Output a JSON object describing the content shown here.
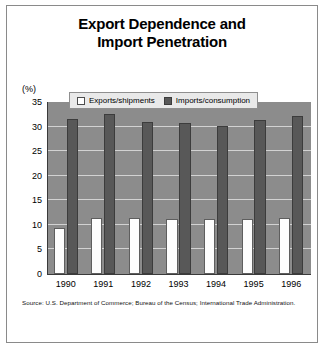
{
  "chart_data": {
    "type": "bar",
    "title": "Export Dependence and Import Penetration",
    "title_lines": [
      "Export Dependence and",
      "Import Penetration"
    ],
    "xlabel": "",
    "ylabel": "",
    "yunit": "(%)",
    "categories": [
      "1990",
      "1991",
      "1992",
      "1993",
      "1994",
      "1995",
      "1996"
    ],
    "series": [
      {
        "name": "Exports/shipments",
        "color": "#ffffff",
        "values": [
          9.3,
          11.3,
          11.3,
          11.2,
          11.1,
          11.1,
          11.4
        ]
      },
      {
        "name": "Imports/consumption",
        "color": "#585858",
        "values": [
          31.5,
          32.5,
          30.9,
          30.8,
          30.2,
          31.3,
          32.2
        ]
      }
    ],
    "ylim": [
      0,
      35
    ],
    "yticks": [
      0,
      5,
      10,
      15,
      20,
      25,
      30,
      35
    ],
    "ytick_labels": [
      "0",
      "5",
      "10",
      "15",
      "20",
      "25",
      "30",
      "35"
    ],
    "grid": true,
    "legend_position": "top-center",
    "plot_background": "#8c8c8c"
  },
  "source": {
    "text": "Source: U.S. Department of Commerce; Bureau of the Census; International Trade Administration."
  }
}
